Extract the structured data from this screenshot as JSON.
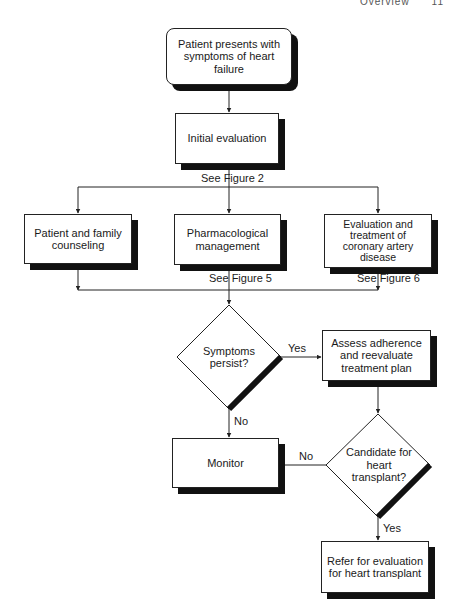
{
  "header": {
    "section": "Overview",
    "page": "11"
  },
  "nodes": {
    "start": "Patient presents with symptoms of heart failure",
    "initial_eval": "Initial evaluation",
    "counseling": "Patient and family counseling",
    "pharm": "Pharmacological management",
    "cad": "Evaluation and treatment of coronary artery disease",
    "symptoms_q": "Symptoms persist?",
    "assess": "Assess adherence and reevaluate treatment plan",
    "monitor": "Monitor",
    "transplant_q": "Candidate for heart transplant?",
    "refer": "Refer for evaluation for heart transplant"
  },
  "refs": {
    "fig2": "See Figure 2",
    "fig5": "See Figure 5",
    "fig6": "See Figure 6"
  },
  "edge_labels": {
    "symptoms_yes": "Yes",
    "symptoms_no": "No",
    "transplant_no": "No",
    "transplant_yes": "Yes"
  }
}
